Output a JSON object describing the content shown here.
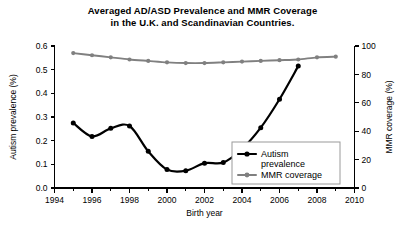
{
  "chart_data": {
    "type": "line",
    "title": "Averaged AD/ASD Prevalence and MMR Coverage in the U.K. and Scandinavian Countries.",
    "title_line_1": "Averaged AD/ASD Prevalence and MMR Coverage",
    "title_line_2": "in the U.K. and Scandinavian Countries.",
    "xlabel": "Birth year",
    "ylabel": "Autism prevalence (%)",
    "y2label": "MMR coverage (%)",
    "xlim": [
      1994,
      2010
    ],
    "ylim": [
      0.0,
      0.6
    ],
    "y2lim": [
      0,
      100
    ],
    "xticks": [
      1994,
      1996,
      1998,
      2000,
      2002,
      2004,
      2006,
      2008,
      2010
    ],
    "xticks_minor": [
      1995,
      1997,
      1999,
      2001,
      2003,
      2005,
      2007,
      2009
    ],
    "xtick_labels": [
      "1994",
      "1996",
      "1998",
      "2000",
      "2002",
      "2004",
      "2006",
      "2008",
      "2010"
    ],
    "yticks": [
      0.0,
      0.1,
      0.2,
      0.3,
      0.4,
      0.5,
      0.6
    ],
    "ytick_labels": [
      "0.0",
      "0.1",
      "0.2",
      "0.3",
      "0.4",
      "0.5",
      "0.6"
    ],
    "y2ticks": [
      0,
      20,
      40,
      60,
      80,
      100
    ],
    "y2tick_labels": [
      "0",
      "20",
      "40",
      "60",
      "80",
      "100"
    ],
    "grid": false,
    "legend_position": "lower right",
    "series": [
      {
        "name": "Autism prevalence",
        "legend_label_line_1": "Autism",
        "legend_label_line_2": "prevalence",
        "axis": "left",
        "color": "#000000",
        "marker": "circle",
        "x": [
          1995,
          1996,
          1997,
          1998,
          1999,
          2000,
          2001,
          2002,
          2003,
          2004,
          2005,
          2006,
          2007
        ],
        "values": [
          0.275,
          0.218,
          0.252,
          0.262,
          0.155,
          0.078,
          0.073,
          0.105,
          0.108,
          0.165,
          0.255,
          0.375,
          0.515
        ]
      },
      {
        "name": "MMR coverage",
        "legend_label_line_1": "MMR coverage",
        "axis": "right",
        "color": "#808080",
        "marker": "circle",
        "x": [
          1995,
          1996,
          1997,
          1998,
          1999,
          2000,
          2001,
          2002,
          2003,
          2004,
          2005,
          2006,
          2007,
          2008,
          2009
        ],
        "values": [
          95.0,
          93.5,
          92.0,
          90.5,
          89.5,
          88.5,
          88.0,
          88.0,
          88.5,
          89.0,
          89.5,
          90.0,
          90.5,
          92.0,
          92.5
        ]
      }
    ]
  }
}
